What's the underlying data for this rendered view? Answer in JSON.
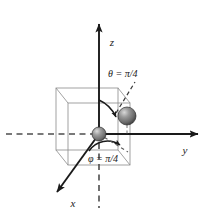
{
  "figure": {
    "name": "spherical-coordinates-diagram",
    "background_color": "#ffffff",
    "axis_color": "#1a1a1a",
    "cube_color": "#8a8a8a",
    "dashed_color": "#4d4d4d",
    "sphere_color": "#7d7d7d"
  },
  "axes": {
    "z": {
      "label": "z",
      "direction": "up",
      "style": "solid-arrow"
    },
    "y": {
      "label": "y",
      "direction": "right",
      "style": "solid-arrow"
    },
    "x": {
      "label": "x",
      "direction": "down-left",
      "style": "solid-arrow"
    },
    "negative_y": {
      "style": "dashed"
    },
    "negative_z": {
      "style": "dashed"
    }
  },
  "annotations": {
    "theta": {
      "label": "θ = π/4",
      "arc": "from-z-axis-to-radius"
    },
    "phi": {
      "label": "φ = π/4",
      "arc": "from-x-axis-to-projection"
    }
  },
  "objects": {
    "origin_sphere": {
      "name": "origin-particle",
      "radius": 7
    },
    "outer_sphere": {
      "name": "positioned-particle",
      "radius": 9
    },
    "cube": {
      "name": "reference-cube",
      "style": "wireframe-oblique"
    }
  }
}
